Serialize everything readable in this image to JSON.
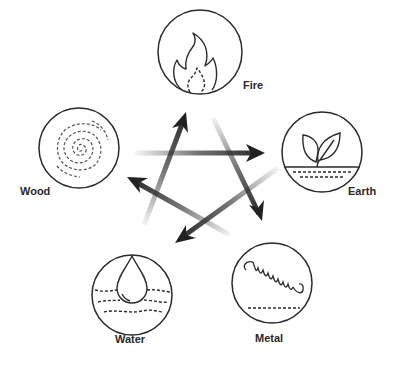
{
  "elements": [
    {
      "id": "fire",
      "label": "Fire",
      "icon": "flame-icon"
    },
    {
      "id": "earth",
      "label": "Earth",
      "icon": "leaf-sprout-icon"
    },
    {
      "id": "metal",
      "label": "Metal",
      "icon": "spring-coil-icon"
    },
    {
      "id": "water",
      "label": "Water",
      "icon": "water-drop-icon"
    },
    {
      "id": "wood",
      "label": "Wood",
      "icon": "wood-rings-icon"
    }
  ],
  "arrows": [
    {
      "from": "Wood",
      "to": "Earth"
    },
    {
      "from": "Fire",
      "to": "Metal"
    },
    {
      "from": "Earth",
      "to": "Water"
    },
    {
      "from": "Metal",
      "to": "Wood"
    },
    {
      "from": "Water",
      "to": "Fire"
    }
  ],
  "colors": {
    "stroke": "#2a2a2a",
    "arrow": "#333333"
  }
}
